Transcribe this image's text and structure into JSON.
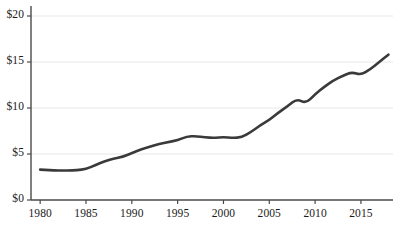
{
  "chart_data": {
    "type": "line",
    "title": "",
    "subtitle": "",
    "xlabel": "",
    "ylabel": "",
    "xlim": [
      1979,
      2018.5
    ],
    "ylim": [
      0,
      20
    ],
    "grid": true,
    "legend": "none",
    "yticks": [
      0,
      5,
      10,
      15,
      20
    ],
    "ytick_labels": [
      "$0",
      "$5",
      "$10",
      "$15",
      "$20"
    ],
    "xticks": [
      1980,
      1985,
      1990,
      1995,
      2000,
      2005,
      2010,
      2015
    ],
    "xtick_labels": [
      "1980",
      "1985",
      "1990",
      "1995",
      "2000",
      "2005",
      "2010",
      "2015"
    ],
    "series": [
      {
        "name": "value",
        "color": "#3a3a3a",
        "line_width": 2.6,
        "x": [
          1980,
          1981,
          1982,
          1983,
          1984,
          1985,
          1986,
          1987,
          1988,
          1989,
          1990,
          1991,
          1992,
          1993,
          1994,
          1995,
          1996,
          1997,
          1998,
          1999,
          2000,
          2001,
          2002,
          2003,
          2004,
          2005,
          2006,
          2007,
          2008,
          2009,
          2010,
          2011,
          2012,
          2013,
          2014,
          2015,
          2016,
          2017,
          2018
        ],
        "values": [
          3.3,
          3.25,
          3.2,
          3.2,
          3.25,
          3.35,
          3.8,
          4.2,
          4.5,
          4.7,
          5.1,
          5.5,
          5.8,
          6.1,
          6.3,
          6.5,
          6.9,
          6.95,
          6.8,
          6.75,
          6.85,
          6.75,
          6.8,
          7.4,
          8.1,
          8.7,
          9.5,
          10.2,
          11.0,
          10.5,
          11.5,
          12.3,
          13.0,
          13.5,
          13.9,
          13.6,
          14.2,
          15.0,
          15.8
        ]
      }
    ]
  },
  "axis_style": {
    "axis_color": "#4a4a4a",
    "grid_color": "#e8e8e8",
    "tick_color": "#4a4a4a",
    "label_color": "#1a1a1a"
  }
}
